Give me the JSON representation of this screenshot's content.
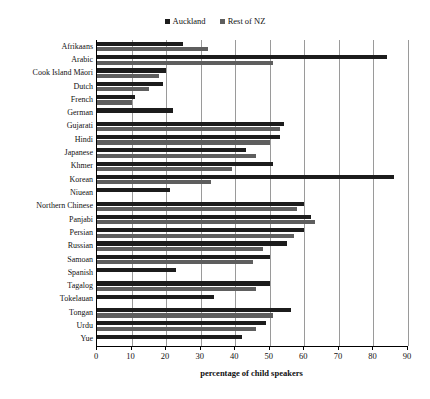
{
  "chart": {
    "title": "",
    "xlabel": "percentage of child speakers",
    "ylabel": ""
  },
  "legend": {
    "position": "top-center",
    "entries": [
      {
        "label": "Auckland",
        "color": "#1c1c1c"
      },
      {
        "label": "Rest of NZ",
        "color": "#5e5e5e"
      }
    ]
  },
  "axis": {
    "ticks": [
      "0",
      "10",
      "20",
      "30",
      "40",
      "50",
      "60",
      "70",
      "80",
      "90"
    ]
  },
  "chart_data": {
    "type": "bar",
    "orientation": "horizontal",
    "title": "",
    "xlabel": "percentage of child speakers",
    "ylabel": "",
    "xlim": [
      0,
      90
    ],
    "xticks": [
      0,
      10,
      20,
      30,
      40,
      50,
      60,
      70,
      80,
      90
    ],
    "grid": true,
    "legend_position": "top-center",
    "categories": [
      "Afrikaans",
      "Arabic",
      "Cook Island Māori",
      "Dutch",
      "French",
      "German",
      "Gujarati",
      "Hindi",
      "Japanese",
      "Khmer",
      "Korean",
      "Niuean",
      "Northern Chinese",
      "Panjabi",
      "Persian",
      "Russian",
      "Samoan",
      "Spanish",
      "Tagalog",
      "Tokelauan",
      "Tongan",
      "Urdu",
      "Yue"
    ],
    "series": [
      {
        "name": "Auckland",
        "color": "#1c1c1c",
        "values": [
          25,
          84,
          20,
          19,
          11,
          22,
          54,
          53,
          43,
          51,
          86,
          21,
          60,
          62,
          60,
          55,
          50,
          23,
          50,
          34,
          56,
          49,
          42
        ]
      },
      {
        "name": "Rest of NZ",
        "color": "#5e5e5e",
        "values": [
          32,
          51,
          18,
          15,
          10,
          0,
          53,
          50,
          46,
          39,
          33,
          0,
          58,
          63,
          57,
          48,
          45,
          0,
          46,
          0,
          51,
          46,
          0
        ]
      }
    ]
  }
}
